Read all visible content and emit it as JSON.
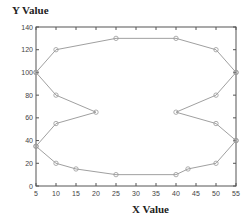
{
  "chart_data": {
    "type": "line",
    "title": "",
    "xlabel": "X Value",
    "ylabel": "Y Value",
    "xlim": [
      5,
      55
    ],
    "ylim": [
      0,
      140
    ],
    "xticks": [
      5,
      10,
      15,
      20,
      25,
      30,
      35,
      40,
      45,
      50,
      55
    ],
    "yticks": [
      0,
      20,
      40,
      60,
      80,
      100,
      120,
      140
    ],
    "grid": false,
    "legend": null,
    "line_color": "#a0a0a0",
    "marker": "circle",
    "series": [
      {
        "name": "top",
        "points": [
          [
            5,
            100
          ],
          [
            10,
            120
          ],
          [
            25,
            130
          ],
          [
            40,
            130
          ],
          [
            50,
            120
          ],
          [
            55,
            100
          ]
        ]
      },
      {
        "name": "left-inner",
        "points": [
          [
            5,
            100
          ],
          [
            10,
            80
          ],
          [
            20,
            65
          ],
          [
            10,
            55
          ],
          [
            5,
            35
          ]
        ]
      },
      {
        "name": "right-inner",
        "points": [
          [
            55,
            100
          ],
          [
            50,
            80
          ],
          [
            40,
            65
          ],
          [
            50,
            55
          ],
          [
            55,
            40
          ]
        ]
      },
      {
        "name": "bottom",
        "points": [
          [
            5,
            35
          ],
          [
            10,
            20
          ],
          [
            15,
            15
          ],
          [
            25,
            10
          ],
          [
            40,
            10
          ],
          [
            43,
            15
          ],
          [
            50,
            20
          ],
          [
            55,
            40
          ]
        ]
      }
    ]
  }
}
